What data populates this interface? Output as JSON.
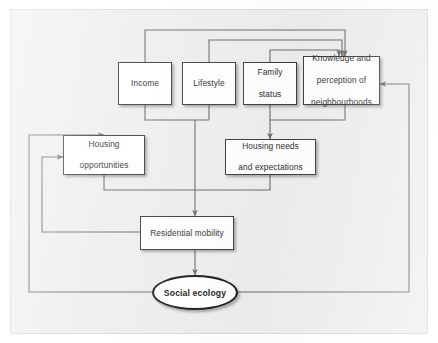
{
  "figure": {
    "type": "flow-diagram",
    "background_color": "#eeeeee",
    "node_fill": "#ffffff",
    "node_border_color": "#3d3d3d",
    "connector_color": "#6b6b6b"
  },
  "nodes": {
    "income": {
      "label": "Income",
      "shape": "rectangle"
    },
    "lifestyle": {
      "label": "Lifestyle",
      "shape": "rectangle"
    },
    "family_status": {
      "label": "Family\nstatus",
      "line1": "Family",
      "line2": "status",
      "shape": "rectangle"
    },
    "knowledge": {
      "label": "Knowledge and perception of neighbourhoods",
      "line1": "Knowledge and",
      "line2": "perception of",
      "line3": "neighbourhoods",
      "shape": "rectangle"
    },
    "housing_opportunities": {
      "label": "Housing opportunities",
      "line1": "Housing",
      "line2": "opportunities",
      "shape": "rectangle"
    },
    "housing_needs": {
      "label": "Housing needs and expectations",
      "line1": "Housing needs",
      "line2": "and expectations",
      "shape": "rectangle"
    },
    "residential_mobility": {
      "label": "Residential mobility",
      "shape": "rectangle"
    },
    "social_ecology": {
      "label": "Social ecology",
      "shape": "ellipse"
    }
  },
  "edges": [
    {
      "from": "income",
      "to": "knowledge",
      "arrow": true
    },
    {
      "from": "lifestyle",
      "to": "knowledge",
      "arrow": true
    },
    {
      "from": "family_status",
      "to": "knowledge",
      "arrow": true
    },
    {
      "from": "income",
      "to": "residential_mobility",
      "arrow": true
    },
    {
      "from": "lifestyle",
      "to": "residential_mobility",
      "arrow": true
    },
    {
      "from": "family_status",
      "to": "housing_needs",
      "arrow": true
    },
    {
      "from": "knowledge",
      "to": "housing_needs",
      "arrow": true
    },
    {
      "from": "housing_opportunities",
      "to": "residential_mobility",
      "arrow": true
    },
    {
      "from": "housing_needs",
      "to": "residential_mobility",
      "arrow": true
    },
    {
      "from": "residential_mobility",
      "to": "housing_opportunities",
      "arrow": true
    },
    {
      "from": "residential_mobility",
      "to": "social_ecology",
      "arrow": true
    },
    {
      "from": "social_ecology",
      "to": "housing_opportunities",
      "arrow": true
    },
    {
      "from": "social_ecology",
      "to": "knowledge",
      "arrow": true
    }
  ]
}
